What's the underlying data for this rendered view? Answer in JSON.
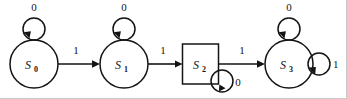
{
  "diagram": {
    "type": "state-machine",
    "colors": {
      "stroke": "#141414",
      "background": "#ffffff",
      "frame": "#c9c9c9"
    },
    "states": [
      {
        "id": "S0",
        "name": "S",
        "subscript": "0",
        "shape": "circle",
        "cx": 34,
        "cy": 64,
        "r": 24
      },
      {
        "id": "S1",
        "name": "S",
        "subscript": "1",
        "shape": "circle",
        "cx": 124,
        "cy": 64,
        "r": 24
      },
      {
        "id": "S2",
        "name": "S",
        "subscript": "2",
        "shape": "rect",
        "cx": 200.5,
        "cy": 64,
        "w": 36,
        "h": 40
      },
      {
        "id": "S3",
        "name": "S",
        "subscript": "3",
        "shape": "circle",
        "cx": 289,
        "cy": 64,
        "r": 24
      }
    ],
    "transitions": [
      {
        "from": "S0",
        "to": "S1",
        "label": "1",
        "kind": "straight",
        "label_x": 76,
        "label_y": 54
      },
      {
        "from": "S1",
        "to": "S2",
        "label": "1",
        "kind": "straight",
        "label_x": 163,
        "label_y": 54
      },
      {
        "from": "S2",
        "to": "S3",
        "label": "1",
        "kind": "straight",
        "label_x": 242,
        "label_y": 54
      }
    ],
    "self_loops": [
      {
        "state": "S0",
        "label": "0",
        "position": "top",
        "cx": 34,
        "cy": 29,
        "r": 11,
        "label_x": 34,
        "label_y": 11
      },
      {
        "state": "S1",
        "label": "0",
        "position": "top",
        "cx": 124,
        "cy": 29,
        "r": 11,
        "label_x": 124,
        "label_y": 11
      },
      {
        "state": "S2",
        "label": "0",
        "position": "bottom-right",
        "cx": 222,
        "cy": 81,
        "r": 11,
        "label_x": 238,
        "label_y": 86
      },
      {
        "state": "S3",
        "label": "0",
        "position": "top",
        "cx": 289,
        "cy": 29,
        "r": 11,
        "label_x": 289,
        "label_y": 11
      },
      {
        "state": "S3",
        "label": "1",
        "position": "right",
        "cx": 319,
        "cy": 64,
        "r": 11,
        "label_x": 335,
        "label_y": 68
      }
    ]
  }
}
